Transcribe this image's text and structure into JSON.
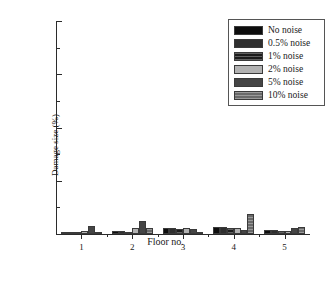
{
  "chart_data": {
    "type": "bar",
    "title": "",
    "xlabel": "Floor no.",
    "ylabel": "Damage size (%)",
    "categories": [
      "1",
      "2",
      "3",
      "4",
      "5"
    ],
    "ylim": [
      0,
      20
    ],
    "yticks": [
      0,
      5,
      10,
      15,
      20
    ],
    "yticklabels": [
      "0",
      "5",
      "10",
      "15",
      "20"
    ],
    "y_minor_ticks": [
      2.5,
      7.5,
      12.5,
      17.5
    ],
    "grid": false,
    "legend_position": "upper right",
    "series": [
      {
        "name": "No noise",
        "values": [
          0.1,
          0.25,
          0.55,
          0.7,
          0.4
        ]
      },
      {
        "name": "0.5% noise",
        "values": [
          0.1,
          0.25,
          0.55,
          0.65,
          0.35
        ]
      },
      {
        "name": "1% noise",
        "values": [
          0.08,
          0.22,
          0.5,
          0.6,
          0.3
        ]
      },
      {
        "name": "2% noise",
        "values": [
          0.25,
          0.55,
          0.6,
          0.6,
          0.3
        ]
      },
      {
        "name": "5% noise",
        "values": [
          0.75,
          1.2,
          0.45,
          0.35,
          0.55
        ]
      },
      {
        "name": "10% noise",
        "values": [
          0.15,
          0.55,
          0.2,
          1.9,
          0.7
        ]
      }
    ]
  },
  "legend": {
    "items": [
      {
        "label": "No noise",
        "pattern": "solid-black"
      },
      {
        "label": "0.5% noise",
        "pattern": "solid-dark-gray"
      },
      {
        "label": "1% noise",
        "pattern": "hatched-dark"
      },
      {
        "label": "2% noise",
        "pattern": "solid-light-gray"
      },
      {
        "label": "5% noise",
        "pattern": "solid-medium-dark-gray"
      },
      {
        "label": "10% noise",
        "pattern": "hatched-medium-gray"
      }
    ]
  },
  "colors": {
    "axis": "#2b2b2b",
    "text": "#1a1a1a",
    "background": "#ffffff",
    "legend_border": "#555555",
    "series": [
      "#0d0d0d",
      "#2f2f2f",
      "#1c1c1c",
      "#b2b2b2",
      "#454545",
      "#6a6a6a"
    ]
  }
}
